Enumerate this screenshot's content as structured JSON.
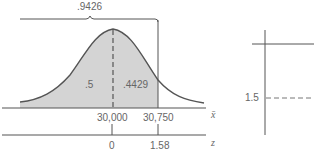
{
  "figure": {
    "bracket_label": ".9426",
    "left_area_label": ".5",
    "right_area_label": ".4429",
    "xbar_axis": {
      "symbol": "x̄",
      "ticks": [
        "30,000",
        "30,750"
      ]
    },
    "z_axis": {
      "symbol": "z",
      "ticks": [
        "0",
        "1.58"
      ]
    },
    "side_chart": {
      "y_tick": "1.5"
    },
    "colors": {
      "shade": "#d4d4d4",
      "curve": "#555555",
      "axis": "#555555"
    }
  }
}
